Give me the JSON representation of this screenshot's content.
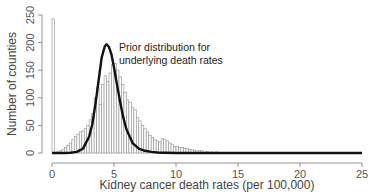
{
  "clipped_header_text": "",
  "chart_data": {
    "type": "bar",
    "title": "",
    "xlabel": "Kidney cancer death rates (per 100,000)",
    "ylabel": "Number of counties",
    "xlim": [
      0,
      25
    ],
    "ylim": [
      0,
      250
    ],
    "xticks": [
      0,
      5,
      10,
      15,
      20,
      25
    ],
    "yticks": [
      0,
      50,
      100,
      150,
      200,
      250
    ],
    "grid": false,
    "bin_width": 0.2,
    "histogram": {
      "name": "Observed county death rates",
      "bin_starts": [
        0.0,
        0.2,
        0.4,
        0.6,
        0.8,
        1.0,
        1.2,
        1.4,
        1.6,
        1.8,
        2.0,
        2.2,
        2.4,
        2.6,
        2.8,
        3.0,
        3.2,
        3.4,
        3.6,
        3.8,
        4.0,
        4.2,
        4.4,
        4.6,
        4.8,
        5.0,
        5.2,
        5.4,
        5.6,
        5.8,
        6.0,
        6.2,
        6.4,
        6.6,
        6.8,
        7.0,
        7.2,
        7.4,
        7.6,
        7.8,
        8.0,
        8.2,
        8.4,
        8.6,
        8.8,
        9.0,
        9.2,
        9.4,
        9.6,
        9.8,
        10.0,
        10.2,
        10.4,
        10.6,
        10.8,
        11.0,
        11.2,
        11.4,
        11.6,
        11.8,
        12.0,
        12.4,
        12.8,
        13.2,
        13.6,
        14.0,
        14.8
      ],
      "counts": [
        243,
        0,
        2,
        4,
        6,
        10,
        14,
        18,
        24,
        30,
        34,
        38,
        40,
        44,
        50,
        60,
        72,
        100,
        118,
        88,
        124,
        140,
        130,
        145,
        160,
        162,
        150,
        138,
        124,
        110,
        96,
        92,
        82,
        78,
        64,
        58,
        50,
        44,
        38,
        32,
        28,
        24,
        22,
        20,
        26,
        24,
        22,
        18,
        16,
        12,
        12,
        10,
        10,
        8,
        8,
        6,
        6,
        5,
        4,
        4,
        4,
        3,
        2,
        2,
        1,
        1,
        1
      ]
    },
    "curve": {
      "name": "Prior distribution for underlying death rates",
      "type": "line",
      "x": [
        0,
        0.5,
        1,
        1.5,
        2,
        2.5,
        3,
        3.25,
        3.5,
        3.75,
        4,
        4.25,
        4.4,
        4.6,
        4.8,
        5,
        5.25,
        5.5,
        5.75,
        6,
        6.5,
        7,
        7.5,
        8,
        8.5,
        9,
        10,
        11,
        12,
        14,
        16,
        18,
        20,
        22,
        25
      ],
      "y": [
        0,
        0,
        0,
        0.5,
        2,
        8,
        30,
        52,
        88,
        130,
        172,
        193,
        197,
        192,
        178,
        155,
        123,
        92,
        64,
        43,
        18,
        8,
        4,
        2,
        1,
        0.5,
        0,
        0,
        0,
        0,
        0,
        0,
        0,
        0,
        0
      ]
    },
    "annotations": [
      {
        "text_line1": "Prior distribution for",
        "text_line2": "underlying death rates",
        "x": 5.4,
        "y": 185,
        "refers_to": "curve"
      }
    ],
    "colors": {
      "bar_stroke": "#9a9a9a",
      "bar_fill": "#ffffff",
      "curve": "#111111",
      "axis": "#777777"
    }
  }
}
